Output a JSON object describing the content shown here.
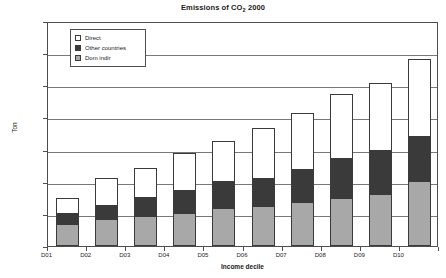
{
  "chart_data": {
    "type": "bar",
    "stacked": true,
    "title": "Emissions of CO2 2000",
    "title_prefix": "Emissions of CO",
    "title_sub": "2",
    "title_suffix": " 2000",
    "xlabel": "Income decile",
    "ylabel": "Ton",
    "categories": [
      "D01",
      "D02",
      "D03",
      "D04",
      "D05",
      "D06",
      "D07",
      "D08",
      "D09",
      "D10"
    ],
    "ylim": [
      0,
      7000000
    ],
    "ytick_labels": [
      "0",
      "1000000",
      "2000000",
      "3000000",
      "4000000",
      "5000000",
      "6000000",
      "7000000"
    ],
    "ytick_values": [
      0,
      1000000,
      2000000,
      3000000,
      4000000,
      5000000,
      6000000,
      7000000
    ],
    "grid": true,
    "legend_position": "upper-left-inside",
    "series": [
      {
        "name": "Dom indir",
        "color": "#a8a8a8",
        "values": [
          650000,
          800000,
          900000,
          1000000,
          1150000,
          1200000,
          1350000,
          1450000,
          1600000,
          2000000
        ]
      },
      {
        "name": "Other countries",
        "color": "#3a3a3a",
        "values": [
          350000,
          450000,
          600000,
          700000,
          850000,
          900000,
          1000000,
          1250000,
          1350000,
          1400000
        ]
      },
      {
        "name": "Direct",
        "color": "#ffffff",
        "values": [
          450000,
          850000,
          900000,
          1150000,
          1250000,
          1550000,
          1750000,
          2000000,
          2100000,
          2400000
        ]
      }
    ],
    "totals": [
      1450000,
      2100000,
      2400000,
      2850000,
      3250000,
      3650000,
      4100000,
      4700000,
      5050000,
      5800000
    ]
  },
  "legend": {
    "items": [
      {
        "label": "Direct",
        "color": "#ffffff"
      },
      {
        "label": "Other countries",
        "color": "#3a3a3a"
      },
      {
        "label": "Dom indir",
        "color": "#a8a8a8"
      }
    ]
  }
}
